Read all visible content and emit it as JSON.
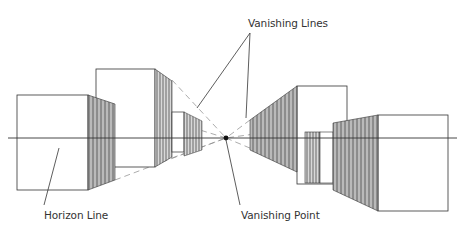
{
  "labels": {
    "vanishing_lines": "Vanishing Lines",
    "horizon_line": "Horizon Line",
    "vanishing_point": "Vanishing Point"
  },
  "colors": {
    "ink": "#333333",
    "hatch": "#555555",
    "dash": "#777777",
    "background": "#ffffff"
  },
  "elements": {
    "vanishing_point": {
      "x": 226,
      "y": 138
    },
    "horizon_line": {
      "x1": 8,
      "x2": 457,
      "y": 138
    },
    "boxes": [
      {
        "name": "left-front-box",
        "side": "left"
      },
      {
        "name": "left-tall-box",
        "side": "left"
      },
      {
        "name": "left-small-box",
        "side": "left"
      },
      {
        "name": "right-tall-box",
        "side": "right"
      },
      {
        "name": "right-small-box",
        "side": "right"
      },
      {
        "name": "right-front-box",
        "side": "right"
      }
    ]
  }
}
